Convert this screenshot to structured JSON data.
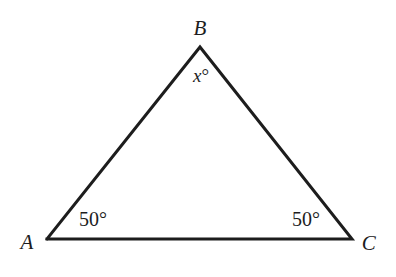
{
  "figure": {
    "kind": "geometry-diagram",
    "shape": "triangle",
    "background_color": "#ffffff",
    "stroke_color": "#1d1d1d",
    "stroke_width": 3,
    "canvas": {
      "width": 396,
      "height": 277
    }
  },
  "vertices": [
    {
      "id": "A",
      "label": "A",
      "x": 47,
      "y": 239
    },
    {
      "id": "B",
      "label": "B",
      "x": 200,
      "y": 47
    },
    {
      "id": "C",
      "label": "C",
      "x": 352,
      "y": 239
    }
  ],
  "angles": [
    {
      "at": "B",
      "label": "x°",
      "symbol": "x",
      "unit": "°",
      "value": null
    },
    {
      "at": "A",
      "label": "50°",
      "symbol": "50",
      "unit": "°",
      "value": 50
    },
    {
      "at": "C",
      "label": "50°",
      "symbol": "50",
      "unit": "°",
      "value": 50
    }
  ],
  "polyline_points": "47,239 200,47 352,239 47,239"
}
